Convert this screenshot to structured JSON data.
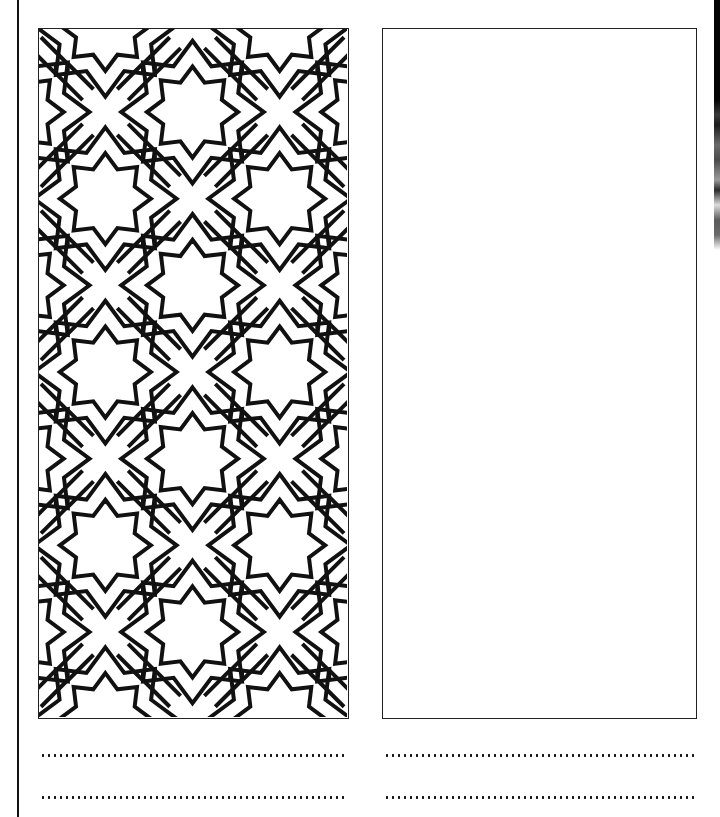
{
  "worksheet": {
    "type": "coloring-and-drawing-sheet",
    "left_panel": {
      "content": "geometric-8-point-star-pattern",
      "line_color": "#000000",
      "fill_color": "#ffffff"
    },
    "right_panel": {
      "content": "empty-drawing-area"
    },
    "writing_lines": {
      "left_count": 2,
      "right_count": 2,
      "style": "dotted"
    }
  },
  "colors": {
    "ink": "#111111",
    "paper": "#ffffff"
  }
}
